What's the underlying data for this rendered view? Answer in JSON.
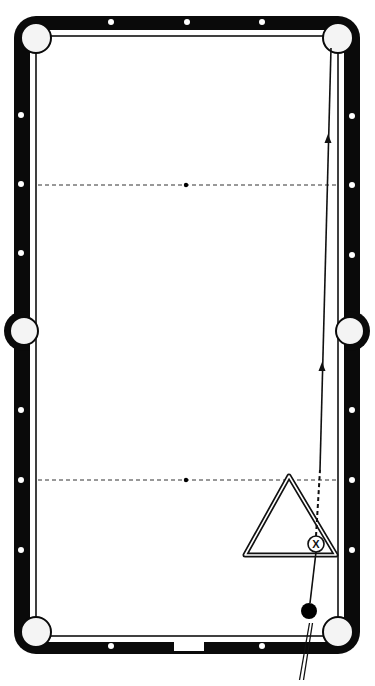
{
  "diagram": {
    "colors": {
      "rail": "#0a0a0a",
      "cloth": "#ffffff",
      "background": "#ffffff",
      "diamond": "#ffffff",
      "line": "#111111"
    },
    "table": {
      "outer": {
        "x": 14,
        "y": 16,
        "w": 346,
        "h": 638,
        "r": 22
      },
      "cushion_line": {
        "x": 36,
        "y": 36,
        "w": 302,
        "h": 600
      }
    },
    "pockets": [
      {
        "name": "top-left-pocket",
        "cx": 36,
        "cy": 38,
        "r": 15
      },
      {
        "name": "top-right-pocket",
        "cx": 338,
        "cy": 38,
        "r": 15
      },
      {
        "name": "side-left-pocket",
        "cx": 24,
        "cy": 331,
        "r": 14
      },
      {
        "name": "side-right-pocket",
        "cx": 350,
        "cy": 331,
        "r": 14
      },
      {
        "name": "bottom-left-pocket",
        "cx": 36,
        "cy": 632,
        "r": 15
      },
      {
        "name": "bottom-right-pocket",
        "cx": 338,
        "cy": 632,
        "r": 15
      }
    ],
    "diamonds": {
      "top": [
        [
          111,
          22
        ],
        [
          187,
          22
        ],
        [
          262,
          22
        ]
      ],
      "bottom": [
        [
          111,
          646
        ],
        [
          262,
          646
        ]
      ],
      "left": [
        [
          21,
          115
        ],
        [
          21,
          184
        ],
        [
          21,
          253
        ],
        [
          21,
          410
        ],
        [
          21,
          480
        ],
        [
          21,
          550
        ]
      ],
      "right": [
        [
          352,
          116
        ],
        [
          352,
          185
        ],
        [
          352,
          255
        ],
        [
          352,
          410
        ],
        [
          352,
          480
        ],
        [
          352,
          550
        ]
      ]
    },
    "head_string": {
      "y": 185,
      "x1": 38,
      "x2": 338,
      "spot_x": 186,
      "label": "head-string"
    },
    "foot_string": {
      "y": 480,
      "x1": 38,
      "x2": 338,
      "spot_x": 186,
      "label": "foot-string"
    },
    "rack": {
      "shape": "triangle",
      "apex": [
        289,
        476
      ],
      "left": [
        245,
        555
      ],
      "right": [
        336,
        555
      ]
    },
    "object_ball": {
      "cx": 316,
      "cy": 544,
      "r": 8,
      "mark": "X"
    },
    "cue_ball": {
      "cx": 309,
      "cy": 611,
      "r": 8
    },
    "cue_stick": {
      "x1": 311,
      "y1": 623,
      "x2": 301,
      "y2": 680
    },
    "shot_path": {
      "dashed": {
        "x1": 316,
        "y1": 536,
        "x2": 320,
        "y2": 470
      },
      "solid": {
        "x1": 320,
        "y1": 470,
        "x2": 331,
        "y2": 48
      },
      "arrows": [
        [
          322,
          368
        ],
        [
          328,
          140
        ]
      ]
    },
    "diamond_slot": {
      "x": 174,
      "y": 641,
      "w": 30,
      "h": 10
    }
  }
}
